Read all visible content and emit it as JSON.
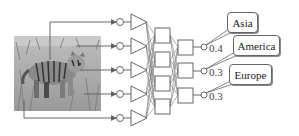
{
  "figure": {
    "input_image": {
      "subject": "tiger-in-grass-photo",
      "tone": "grayscale"
    },
    "layers": {
      "input_nodes": 5,
      "first_layer_units": 5,
      "hidden_units": 4,
      "output_units": 3
    },
    "outputs": [
      {
        "label": "Asia",
        "probability": "0.4"
      },
      {
        "label": "America",
        "probability": "0.3"
      },
      {
        "label": "Europe",
        "probability": "0.3"
      }
    ],
    "colors": {
      "line": "#666666",
      "photo_bg": "#a8a8a8",
      "callout_border": "#666666"
    }
  }
}
